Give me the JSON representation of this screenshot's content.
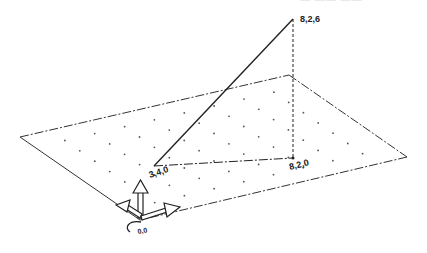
{
  "top_caption": "— —— ——",
  "plane": {
    "corners": [
      [
        20,
        137
      ],
      [
        289,
        75
      ],
      [
        407,
        157
      ],
      [
        140,
        220
      ]
    ],
    "grid_u": 9,
    "grid_v": 8,
    "edge_color": "#333333",
    "dot_color": "#555555"
  },
  "triangle": {
    "apex": [
      293,
      19
    ],
    "left": [
      154,
      166
    ],
    "base_right": [
      293,
      158
    ],
    "color": "#222222"
  },
  "labels": {
    "apex": "8,2,6",
    "left": "3,4,0",
    "base_right": "8,2,0",
    "origin": "0,0"
  },
  "gizmo": {
    "origin": [
      140,
      218
    ],
    "color": "#222222"
  }
}
